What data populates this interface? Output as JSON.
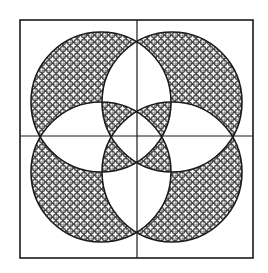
{
  "figure": {
    "title": "",
    "colors": {
      "background": "#ffffff",
      "ink": "#1a1a1a",
      "hatch": "#2a2a2a"
    },
    "frame": {
      "x": 20,
      "y": 20,
      "width": 233,
      "height": 238
    },
    "dividers": {
      "vertical_x": 137,
      "horizontal_y": 136
    },
    "circles": [
      {
        "name": "top-left",
        "cx": 101,
        "cy": 102,
        "r": 70
      },
      {
        "name": "top-right",
        "cx": 172,
        "cy": 102,
        "r": 70
      },
      {
        "name": "bottom-left",
        "cx": 101,
        "cy": 172,
        "r": 70
      },
      {
        "name": "bottom-right",
        "cx": 172,
        "cy": 172,
        "r": 70
      }
    ],
    "fill_rule": "evenodd",
    "hatch_pattern": {
      "cell": 7,
      "circle_r": 3.5
    }
  }
}
